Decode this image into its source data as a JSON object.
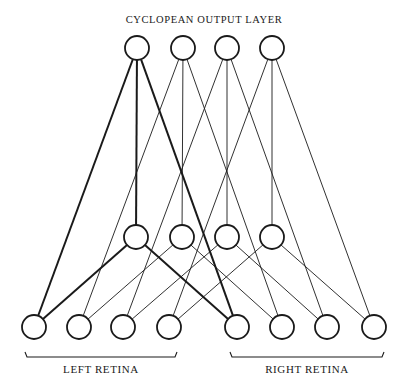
{
  "title": "CYCLOPEAN OUTPUT LAYER",
  "labels": {
    "left_retina": "LEFT RETINA",
    "right_retina": "RIGHT RETINA"
  },
  "layers": {
    "output": {
      "name": "cyclopean-output",
      "count": 4
    },
    "hidden": {
      "name": "hidden",
      "count": 4
    },
    "left_retina": {
      "name": "left-retina",
      "count": 4
    },
    "right_retina": {
      "name": "right-retina",
      "count": 4
    }
  },
  "connections": [
    {
      "from": "output",
      "to": "hidden",
      "rule": "same-index"
    },
    {
      "from": "output",
      "to": "left_retina",
      "rule": "same-index"
    },
    {
      "from": "output",
      "to": "right_retina",
      "rule": "same-index"
    },
    {
      "from": "hidden",
      "to": "left_retina",
      "rule": "same-index"
    },
    {
      "from": "hidden",
      "to": "right_retina",
      "rule": "same-index"
    }
  ],
  "highlighted_index": 0,
  "colors": {
    "ink": "#1a1a1a",
    "background": "#ffffff"
  }
}
